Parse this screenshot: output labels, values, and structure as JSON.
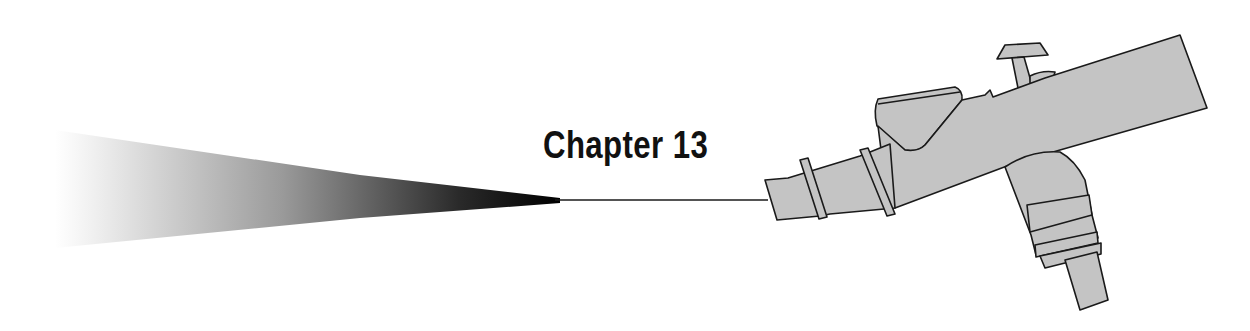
{
  "heading": {
    "chapter_label": "Chapter 13"
  },
  "illustration": {
    "subject": "airbrush-spraying",
    "icons": [
      "airbrush-icon",
      "spray-cone-icon"
    ],
    "colors": {
      "airbrush_fill": "#c4c4c4",
      "outline": "#1a1a1a",
      "spray_dark": "#000000",
      "spray_light": "#ffffff"
    }
  }
}
